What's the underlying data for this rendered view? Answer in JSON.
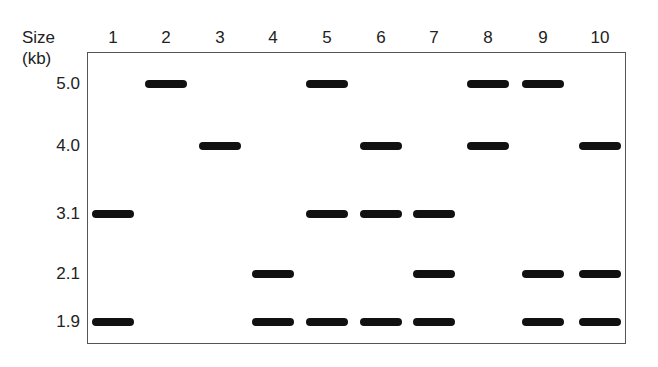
{
  "axis": {
    "title_line1": "Size",
    "title_line2": "(kb)"
  },
  "lanes": [
    {
      "label": "1",
      "x": 113
    },
    {
      "label": "2",
      "x": 166
    },
    {
      "label": "3",
      "x": 220
    },
    {
      "label": "4",
      "x": 273
    },
    {
      "label": "5",
      "x": 327
    },
    {
      "label": "6",
      "x": 381
    },
    {
      "label": "7",
      "x": 434
    },
    {
      "label": "8",
      "x": 488
    },
    {
      "label": "9",
      "x": 543
    },
    {
      "label": "10",
      "x": 600
    }
  ],
  "sizes": [
    {
      "label": "5.0",
      "y": 84
    },
    {
      "label": "4.0",
      "y": 146
    },
    {
      "label": "3.1",
      "y": 214
    },
    {
      "label": "2.1",
      "y": 274
    },
    {
      "label": "1.9",
      "y": 322
    }
  ],
  "bands": {
    "1": [
      "3.1",
      "1.9"
    ],
    "2": [
      "5.0"
    ],
    "3": [
      "4.0"
    ],
    "4": [
      "2.1",
      "1.9"
    ],
    "5": [
      "5.0",
      "3.1",
      "1.9"
    ],
    "6": [
      "4.0",
      "3.1",
      "1.9"
    ],
    "7": [
      "3.1",
      "2.1",
      "1.9"
    ],
    "8": [
      "5.0",
      "4.0"
    ],
    "9": [
      "5.0",
      "2.1",
      "1.9"
    ],
    "10": [
      "4.0",
      "2.1",
      "1.9"
    ]
  },
  "colors": {
    "band": "#111111",
    "border": "#555555",
    "background": "#ffffff"
  }
}
